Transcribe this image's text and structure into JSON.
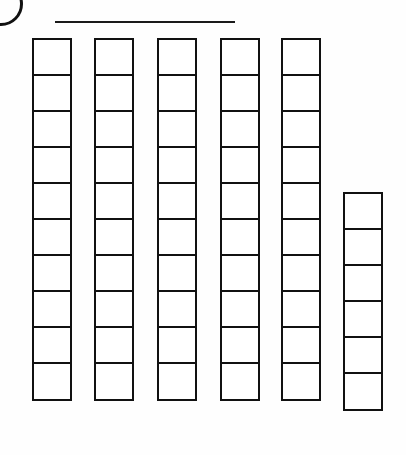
{
  "page": {
    "width": 406,
    "height": 455,
    "background_color": "#fefefe",
    "ink_color": "#111111"
  },
  "question_marker": {
    "icon": "circle-outline-partial",
    "label": "",
    "description": "Partially visible circled question number at top-left corner, cropped by page edge"
  },
  "answer_line": {
    "label": "",
    "description": "Blank horizontal answer line",
    "x": 55,
    "y": 21,
    "length": 180
  },
  "chart_data": {
    "type": "bar",
    "title": "",
    "subtitle": "",
    "xlabel": "",
    "ylabel": "",
    "categories": [
      "1",
      "2",
      "3",
      "4",
      "5",
      "6"
    ],
    "values": [
      10,
      10,
      10,
      10,
      10,
      6
    ],
    "unit": "unit square",
    "total": 56,
    "grid": false,
    "legend": false,
    "ylim": [
      0,
      10
    ],
    "orientation": "vertical",
    "baseline": "bottom-aligned",
    "annotations": [],
    "tick_labels": []
  },
  "columns": [
    {
      "name": "column-1",
      "cells": 10,
      "left": 32,
      "top": 38,
      "width": 40,
      "height": 386,
      "cell_height": 38.6
    },
    {
      "name": "column-2",
      "cells": 10,
      "left": 94,
      "top": 38,
      "width": 40,
      "height": 386,
      "cell_height": 38.6
    },
    {
      "name": "column-3",
      "cells": 10,
      "left": 157,
      "top": 38,
      "width": 40,
      "height": 386,
      "cell_height": 38.6
    },
    {
      "name": "column-4",
      "cells": 10,
      "left": 220,
      "top": 38,
      "width": 40,
      "height": 386,
      "cell_height": 38.6
    },
    {
      "name": "column-5",
      "cells": 10,
      "left": 281,
      "top": 38,
      "width": 40,
      "height": 386,
      "cell_height": 38.6
    },
    {
      "name": "column-6",
      "cells": 6,
      "left": 343,
      "top": 192,
      "width": 40,
      "height": 232,
      "cell_height": 38.6
    }
  ]
}
